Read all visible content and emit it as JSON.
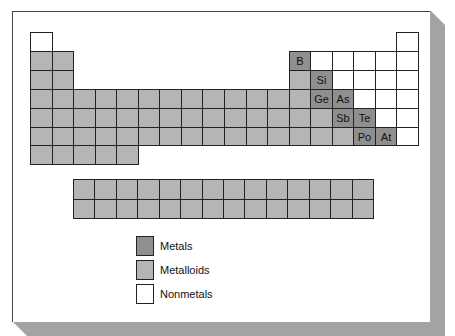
{
  "diagram": {
    "title": "",
    "colors": {
      "dark": "#8f8f8f",
      "light": "#b5b5b5",
      "white": "#ffffff",
      "shadow": "#a3a3a3"
    },
    "main_grid": {
      "columns": 18,
      "rows": 7,
      "origin": [
        30,
        32
      ],
      "cell_w": 21.55,
      "cell_h": 18.9,
      "cells": [
        {
          "r": 1,
          "c": 1,
          "fill": "white",
          "label": ""
        },
        {
          "r": 1,
          "c": 18,
          "fill": "white",
          "label": ""
        },
        {
          "r": 2,
          "c": 1,
          "fill": "light",
          "label": ""
        },
        {
          "r": 2,
          "c": 2,
          "fill": "light",
          "label": ""
        },
        {
          "r": 2,
          "c": 13,
          "fill": "dark",
          "label": "B"
        },
        {
          "r": 2,
          "c": 14,
          "fill": "white",
          "label": ""
        },
        {
          "r": 2,
          "c": 15,
          "fill": "white",
          "label": ""
        },
        {
          "r": 2,
          "c": 16,
          "fill": "white",
          "label": ""
        },
        {
          "r": 2,
          "c": 17,
          "fill": "white",
          "label": ""
        },
        {
          "r": 2,
          "c": 18,
          "fill": "white",
          "label": ""
        },
        {
          "r": 3,
          "c": 1,
          "fill": "light",
          "label": ""
        },
        {
          "r": 3,
          "c": 2,
          "fill": "light",
          "label": ""
        },
        {
          "r": 3,
          "c": 13,
          "fill": "light",
          "label": ""
        },
        {
          "r": 3,
          "c": 14,
          "fill": "dark",
          "label": "Si"
        },
        {
          "r": 3,
          "c": 15,
          "fill": "white",
          "label": ""
        },
        {
          "r": 3,
          "c": 16,
          "fill": "white",
          "label": ""
        },
        {
          "r": 3,
          "c": 17,
          "fill": "white",
          "label": ""
        },
        {
          "r": 3,
          "c": 18,
          "fill": "white",
          "label": ""
        },
        {
          "r": 4,
          "c": 1,
          "fill": "light",
          "label": ""
        },
        {
          "r": 4,
          "c": 2,
          "fill": "light",
          "label": ""
        },
        {
          "r": 4,
          "c": 3,
          "fill": "light",
          "label": ""
        },
        {
          "r": 4,
          "c": 4,
          "fill": "light",
          "label": ""
        },
        {
          "r": 4,
          "c": 5,
          "fill": "light",
          "label": ""
        },
        {
          "r": 4,
          "c": 6,
          "fill": "light",
          "label": ""
        },
        {
          "r": 4,
          "c": 7,
          "fill": "light",
          "label": ""
        },
        {
          "r": 4,
          "c": 8,
          "fill": "light",
          "label": ""
        },
        {
          "r": 4,
          "c": 9,
          "fill": "light",
          "label": ""
        },
        {
          "r": 4,
          "c": 10,
          "fill": "light",
          "label": ""
        },
        {
          "r": 4,
          "c": 11,
          "fill": "light",
          "label": ""
        },
        {
          "r": 4,
          "c": 12,
          "fill": "light",
          "label": ""
        },
        {
          "r": 4,
          "c": 13,
          "fill": "light",
          "label": ""
        },
        {
          "r": 4,
          "c": 14,
          "fill": "dark",
          "label": "Ge"
        },
        {
          "r": 4,
          "c": 15,
          "fill": "dark",
          "label": "As"
        },
        {
          "r": 4,
          "c": 16,
          "fill": "white",
          "label": ""
        },
        {
          "r": 4,
          "c": 17,
          "fill": "white",
          "label": ""
        },
        {
          "r": 4,
          "c": 18,
          "fill": "white",
          "label": ""
        },
        {
          "r": 5,
          "c": 1,
          "fill": "light",
          "label": ""
        },
        {
          "r": 5,
          "c": 2,
          "fill": "light",
          "label": ""
        },
        {
          "r": 5,
          "c": 3,
          "fill": "light",
          "label": ""
        },
        {
          "r": 5,
          "c": 4,
          "fill": "light",
          "label": ""
        },
        {
          "r": 5,
          "c": 5,
          "fill": "light",
          "label": ""
        },
        {
          "r": 5,
          "c": 6,
          "fill": "light",
          "label": ""
        },
        {
          "r": 5,
          "c": 7,
          "fill": "light",
          "label": ""
        },
        {
          "r": 5,
          "c": 8,
          "fill": "light",
          "label": ""
        },
        {
          "r": 5,
          "c": 9,
          "fill": "light",
          "label": ""
        },
        {
          "r": 5,
          "c": 10,
          "fill": "light",
          "label": ""
        },
        {
          "r": 5,
          "c": 11,
          "fill": "light",
          "label": ""
        },
        {
          "r": 5,
          "c": 12,
          "fill": "light",
          "label": ""
        },
        {
          "r": 5,
          "c": 13,
          "fill": "light",
          "label": ""
        },
        {
          "r": 5,
          "c": 14,
          "fill": "light",
          "label": ""
        },
        {
          "r": 5,
          "c": 15,
          "fill": "dark",
          "label": "Sb"
        },
        {
          "r": 5,
          "c": 16,
          "fill": "dark",
          "label": "Te"
        },
        {
          "r": 5,
          "c": 17,
          "fill": "white",
          "label": ""
        },
        {
          "r": 5,
          "c": 18,
          "fill": "white",
          "label": ""
        },
        {
          "r": 6,
          "c": 1,
          "fill": "light",
          "label": ""
        },
        {
          "r": 6,
          "c": 2,
          "fill": "light",
          "label": ""
        },
        {
          "r": 6,
          "c": 3,
          "fill": "light",
          "label": ""
        },
        {
          "r": 6,
          "c": 4,
          "fill": "light",
          "label": ""
        },
        {
          "r": 6,
          "c": 5,
          "fill": "light",
          "label": ""
        },
        {
          "r": 6,
          "c": 6,
          "fill": "light",
          "label": ""
        },
        {
          "r": 6,
          "c": 7,
          "fill": "light",
          "label": ""
        },
        {
          "r": 6,
          "c": 8,
          "fill": "light",
          "label": ""
        },
        {
          "r": 6,
          "c": 9,
          "fill": "light",
          "label": ""
        },
        {
          "r": 6,
          "c": 10,
          "fill": "light",
          "label": ""
        },
        {
          "r": 6,
          "c": 11,
          "fill": "light",
          "label": ""
        },
        {
          "r": 6,
          "c": 12,
          "fill": "light",
          "label": ""
        },
        {
          "r": 6,
          "c": 13,
          "fill": "light",
          "label": ""
        },
        {
          "r": 6,
          "c": 14,
          "fill": "light",
          "label": ""
        },
        {
          "r": 6,
          "c": 15,
          "fill": "light",
          "label": ""
        },
        {
          "r": 6,
          "c": 16,
          "fill": "dark",
          "label": "Po"
        },
        {
          "r": 6,
          "c": 17,
          "fill": "dark",
          "label": "At"
        },
        {
          "r": 6,
          "c": 18,
          "fill": "white",
          "label": ""
        },
        {
          "r": 7,
          "c": 1,
          "fill": "light",
          "label": ""
        },
        {
          "r": 7,
          "c": 2,
          "fill": "light",
          "label": ""
        },
        {
          "r": 7,
          "c": 3,
          "fill": "light",
          "label": ""
        },
        {
          "r": 7,
          "c": 4,
          "fill": "light",
          "label": ""
        },
        {
          "r": 7,
          "c": 5,
          "fill": "light",
          "label": ""
        }
      ]
    },
    "inner_transition_block": {
      "columns": 14,
      "rows": 2,
      "origin": [
        73,
        179
      ],
      "cell_w": 21.43,
      "cell_h": 19.5,
      "fill": "light"
    },
    "legend": {
      "items": [
        {
          "label": "Metals",
          "fill": "dark",
          "top": 236
        },
        {
          "label": "Metalloids",
          "fill": "light",
          "top": 260
        },
        {
          "label": "Nonmetals",
          "fill": "white",
          "top": 284
        }
      ]
    }
  }
}
